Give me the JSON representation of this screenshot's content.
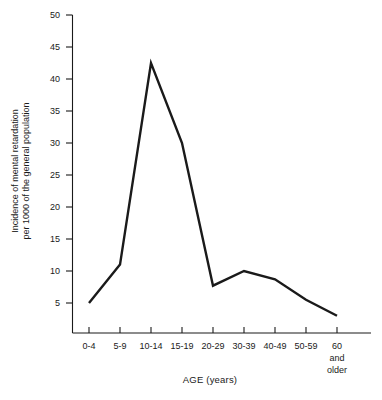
{
  "chart_data": {
    "type": "line",
    "title": "",
    "xlabel": "AGE (years)",
    "ylabel": "Incidence of mental retardation per 1000 of the general population",
    "ylabel_line1": "Incidence of mental retardation",
    "ylabel_line2": "per 1000 of the general population",
    "categories": [
      "0-4",
      "5-9",
      "10-14",
      "15-19",
      "20-29",
      "30-39",
      "40-49",
      "50-59",
      "60 and older"
    ],
    "category_sub_lines": [
      [],
      [],
      [],
      [],
      [],
      [],
      [],
      [],
      [
        "and",
        "older"
      ]
    ],
    "category_main_labels": [
      "0-4",
      "5-9",
      "10-14",
      "15-19",
      "20-29",
      "30-39",
      "40-49",
      "50-59",
      "60"
    ],
    "values": [
      5,
      11,
      42.5,
      30,
      7.7,
      10,
      8.7,
      5.5,
      3
    ],
    "ylim": [
      0,
      50
    ],
    "y_ticks": [
      5,
      10,
      15,
      20,
      25,
      30,
      35,
      40,
      45,
      50
    ],
    "y_tick_labels": [
      "5",
      "10",
      "15",
      "20",
      "25",
      "30",
      "35",
      "40",
      "45",
      "50"
    ],
    "grid": false,
    "legend": false,
    "legend_position": "none",
    "line_color": "#1a1a1a",
    "line_width": 2.4,
    "axis_color": "#1a1a1a",
    "background": "#ffffff"
  },
  "axis": {
    "x_title": "AGE (years)",
    "y_title_line1": "Incidence of mental retardation",
    "y_title_line2": "per 1000 of the general population"
  },
  "y_labels": [
    "50",
    "45",
    "40",
    "35",
    "30",
    "25",
    "20",
    "15",
    "10",
    "5"
  ],
  "x_labels": [
    "0-4",
    "5-9",
    "10-14",
    "15-19",
    "20-29",
    "30-39",
    "40-49",
    "50-59",
    "60"
  ],
  "x_last_extra": {
    "line2": "and",
    "line3": "older"
  }
}
